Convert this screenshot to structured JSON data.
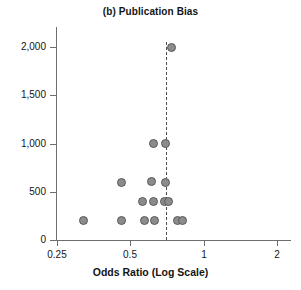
{
  "chart_data": {
    "type": "scatter",
    "title": "(b) Publication Bias",
    "xlabel": "Odds Ratio (Log Scale)",
    "ylabel": "",
    "xscale": "log",
    "yscale": "linear",
    "xlim": [
      0.25,
      2
    ],
    "ylim": [
      0,
      2100
    ],
    "grid": false,
    "legend": null,
    "x_ticks": [
      {
        "value": 0.25,
        "label": "0.25"
      },
      {
        "value": 0.5,
        "label": "0.5"
      },
      {
        "value": 1,
        "label": "1"
      },
      {
        "value": 2,
        "label": "2"
      }
    ],
    "y_ticks": [
      {
        "value": 0,
        "label": "0"
      },
      {
        "value": 500,
        "label": "500"
      },
      {
        "value": 1000,
        "label": "1,000"
      },
      {
        "value": 1500,
        "label": "1,500"
      },
      {
        "value": 2000,
        "label": "2,000"
      }
    ],
    "annotations": [
      {
        "kind": "vline",
        "name": "pooled-estimate-line",
        "x": 0.7,
        "style": "dashed"
      }
    ],
    "points": [
      {
        "x": 0.32,
        "y": 200
      },
      {
        "x": 0.46,
        "y": 200
      },
      {
        "x": 0.57,
        "y": 200
      },
      {
        "x": 0.63,
        "y": 200
      },
      {
        "x": 0.78,
        "y": 200
      },
      {
        "x": 0.82,
        "y": 200
      },
      {
        "x": 0.56,
        "y": 400
      },
      {
        "x": 0.62,
        "y": 400
      },
      {
        "x": 0.69,
        "y": 400
      },
      {
        "x": 0.72,
        "y": 400
      },
      {
        "x": 0.46,
        "y": 600
      },
      {
        "x": 0.61,
        "y": 610
      },
      {
        "x": 0.7,
        "y": 600
      },
      {
        "x": 0.62,
        "y": 1000
      },
      {
        "x": 0.7,
        "y": 1000
      },
      {
        "x": 0.74,
        "y": 2000
      }
    ],
    "marker": {
      "shape": "circle",
      "fill": "#8c8c8c",
      "stroke": "#595959",
      "size_px": 9
    }
  },
  "geometry": {
    "x_px": {
      "0.25": 57,
      "0.5": 133,
      "1": 205,
      "2": 277
    },
    "y_px": {
      "0": 240,
      "500": 192,
      "1000": 144,
      "1500": 96,
      "2000": 47
    },
    "vline_px": 172
  }
}
